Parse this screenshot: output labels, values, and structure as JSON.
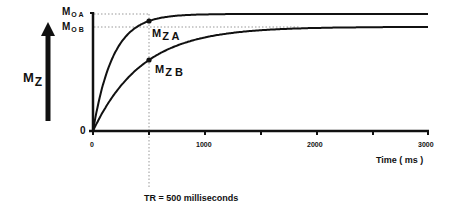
{
  "chart_data": {
    "type": "line",
    "title": "",
    "xlabel": "Time ( ms )",
    "ylabel": "M_Z",
    "xlim": [
      0,
      3000
    ],
    "x_ticks": [
      0,
      500,
      1000,
      1500,
      2000,
      2500,
      3000
    ],
    "x_tick_labels": [
      "0",
      "1000",
      "2000",
      "3000"
    ],
    "y_tick_labels": [
      "0",
      "M0 A",
      "M0 B"
    ],
    "grid": false,
    "legend": null,
    "series": [
      {
        "name": "M_Z A",
        "M0": 1.0,
        "T1_ms_est": 178,
        "value_at_TR_fraction": 0.94
      },
      {
        "name": "M_Z B",
        "M0": 0.89,
        "T1_ms_est": 438,
        "value_at_TR_fraction": 0.68
      }
    ],
    "annotations": [
      {
        "text": "TR = 500 milliseconds",
        "x": 500,
        "type": "vertical-dotted-line"
      },
      {
        "text": "M_Z A",
        "x": 500,
        "type": "marker"
      },
      {
        "text": "M_Z B",
        "x": 500,
        "type": "marker"
      }
    ]
  },
  "labels": {
    "mz_main": "M",
    "mz_main_sub": "Z",
    "m0a": "M",
    "m0a_sub": "O  A",
    "m0b": "M",
    "m0b_sub": "O  B",
    "zero_y": "0",
    "mza": "M",
    "mza_sub": "Z A",
    "mzb": "M",
    "mzb_sub": "Z B",
    "x0": "0",
    "x1000": "1000",
    "x2000": "2000",
    "x3000": "3000",
    "xlabel": "Time ( ms )",
    "tr": "TR = 500 milliseconds"
  }
}
